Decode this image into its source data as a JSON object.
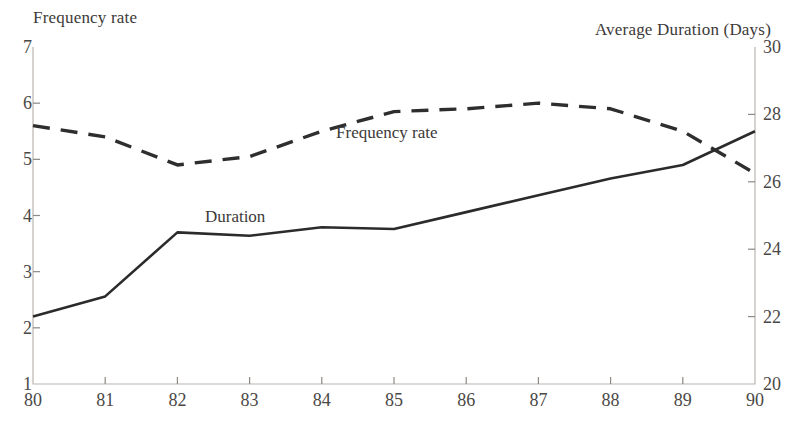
{
  "chart_data": {
    "type": "line",
    "title": "",
    "xlabel": "",
    "categories": [
      "80",
      "81",
      "82",
      "83",
      "84",
      "85",
      "86",
      "87",
      "88",
      "89",
      "90"
    ],
    "x": [
      80,
      81,
      82,
      83,
      84,
      85,
      86,
      87,
      88,
      89,
      90
    ],
    "grid": false,
    "legend_position": "inline-annotation",
    "axes": {
      "left": {
        "label": "Frequency rate",
        "min": 1,
        "max": 7,
        "step": 1,
        "ticks": [
          "1",
          "2",
          "3",
          "4",
          "5",
          "6",
          "7"
        ]
      },
      "right": {
        "label": "Average Duration (Days)",
        "min": 20,
        "max": 30,
        "step": 2,
        "ticks": [
          "20",
          "22",
          "24",
          "26",
          "28",
          "30"
        ]
      },
      "bottom": {
        "ticks": [
          "80",
          "81",
          "82",
          "83",
          "84",
          "85",
          "86",
          "87",
          "88",
          "89",
          "90"
        ]
      }
    },
    "series": [
      {
        "name": "Frequency rate",
        "axis": "left",
        "style": "dashed",
        "color": "#2e2e2e",
        "annotation": "Frequency rate",
        "values": [
          5.6,
          5.4,
          4.9,
          5.05,
          5.5,
          5.85,
          5.9,
          6.0,
          5.9,
          5.5,
          4.75
        ]
      },
      {
        "name": "Duration",
        "axis": "right",
        "style": "solid",
        "color": "#2b2b2b",
        "annotation": "Duration",
        "values": [
          22.0,
          22.6,
          24.5,
          24.4,
          24.65,
          24.6,
          25.1,
          25.6,
          26.1,
          26.5,
          27.5
        ]
      }
    ],
    "annotations": [
      {
        "text": "Frequency rate",
        "x": 84.9,
        "value_left": 5.45
      },
      {
        "text": "Duration",
        "x": 82.8,
        "value_left": 3.95
      }
    ]
  }
}
